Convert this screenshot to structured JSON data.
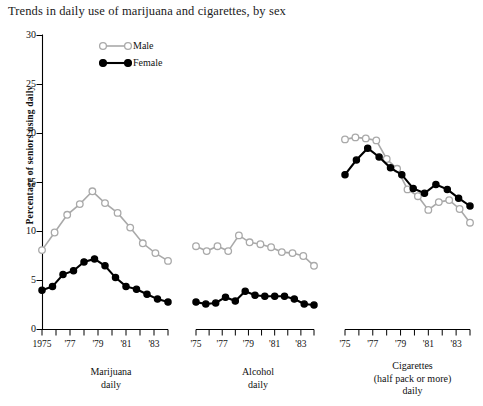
{
  "title": "Trends in daily use of marijuana and cigarettes, by sex",
  "ylabel": "Percentage of seniors using daily",
  "legend": {
    "male": "Male",
    "female": "Female"
  },
  "yticks": [
    "0",
    "5",
    "10",
    "15",
    "20",
    "25",
    "30"
  ],
  "panels": [
    {
      "id": "marijuana",
      "caption_line1": "Marijuana",
      "caption_line2": "daily",
      "caption_line3": "",
      "xtick_labels": [
        "1975",
        "",
        "'77",
        "",
        "'79",
        "",
        "'81",
        "",
        "'83",
        ""
      ]
    },
    {
      "id": "alcohol",
      "caption_line1": "Alcohol",
      "caption_line2": "daily",
      "caption_line3": "",
      "xtick_labels": [
        "'75",
        "",
        "'77",
        "",
        "'79",
        "",
        "'81",
        "",
        "'83",
        ""
      ]
    },
    {
      "id": "cigarettes",
      "caption_line1": "Cigarettes",
      "caption_line2": "(half pack or more)",
      "caption_line3": "daily",
      "xtick_labels": [
        "'75",
        "",
        "'77",
        "",
        "'79",
        "",
        "'81",
        "",
        "'83",
        ""
      ]
    }
  ],
  "chart_data": {
    "type": "line",
    "title": "Trends in daily use of marijuana and cigarettes, by sex",
    "xlabel": "",
    "ylabel": "Percentage of seniors using daily",
    "ylim": [
      0,
      30
    ],
    "yticks": [
      0,
      5,
      10,
      15,
      20,
      25,
      30
    ],
    "grid": false,
    "legend_position": "top-left inside plot",
    "legend_entries": [
      "Male",
      "Female"
    ],
    "panels": [
      {
        "name": "Marijuana daily",
        "x": [
          1975,
          1976,
          1977,
          1978,
          1979,
          1980,
          1981,
          1982,
          1983,
          1984
        ],
        "series": [
          {
            "name": "Male",
            "marker": "open-circle",
            "color": "#a9a9a9",
            "values": [
              8.1,
              9.9,
              11.7,
              12.8,
              14.1,
              12.9,
              11.9,
              10.4,
              8.8,
              7.8,
              7.0
            ]
          },
          {
            "name": "Female",
            "marker": "filled-circle",
            "color": "#000000",
            "values": [
              4.0,
              4.4,
              5.6,
              6.0,
              6.9,
              7.2,
              6.5,
              5.3,
              4.4,
              4.1,
              3.6,
              3.1,
              2.8
            ]
          }
        ]
      },
      {
        "name": "Alcohol daily",
        "x": [
          1975,
          1976,
          1977,
          1978,
          1979,
          1980,
          1981,
          1982,
          1983,
          1984
        ],
        "series": [
          {
            "name": "Male",
            "marker": "open-circle",
            "color": "#a9a9a9",
            "values": [
              8.5,
              8.0,
              8.5,
              8.0,
              9.6,
              8.9,
              8.7,
              8.4,
              7.9,
              7.8,
              7.5,
              6.5
            ]
          },
          {
            "name": "Female",
            "marker": "filled-circle",
            "color": "#000000",
            "values": [
              2.8,
              2.6,
              2.7,
              3.3,
              2.9,
              3.9,
              3.5,
              3.4,
              3.4,
              3.4,
              3.1,
              2.6,
              2.5
            ]
          }
        ]
      },
      {
        "name": "Cigarettes (half pack or more) daily",
        "x": [
          1975,
          1976,
          1977,
          1978,
          1979,
          1980,
          1981,
          1982,
          1983,
          1984
        ],
        "series": [
          {
            "name": "Male",
            "marker": "open-circle",
            "color": "#a9a9a9",
            "values": [
              19.4,
              19.6,
              19.5,
              19.3,
              17.4,
              16.4,
              14.3,
              13.6,
              12.2,
              13.0,
              13.2,
              12.3,
              10.9
            ]
          },
          {
            "name": "Female",
            "marker": "filled-circle",
            "color": "#000000",
            "values": [
              15.8,
              17.3,
              18.5,
              17.6,
              16.5,
              15.8,
              14.4,
              13.9,
              14.8,
              14.3,
              13.4,
              12.6
            ]
          }
        ]
      }
    ]
  }
}
